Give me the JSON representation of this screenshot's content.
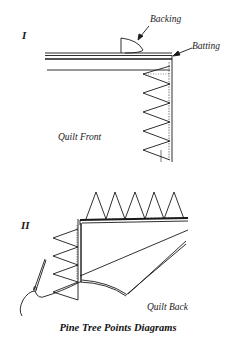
{
  "diagram": {
    "caption": "Pine Tree Points Diagrams",
    "panel_1": {
      "numeral": "I",
      "labels": {
        "backing": "Backing",
        "batting": "Batting",
        "quilt_front": "Quilt Front"
      }
    },
    "panel_2": {
      "numeral": "II",
      "labels": {
        "quilt_back": "Quilt Back"
      }
    },
    "colors": {
      "ink": "#1a1a1a",
      "background": "#ffffff"
    }
  }
}
